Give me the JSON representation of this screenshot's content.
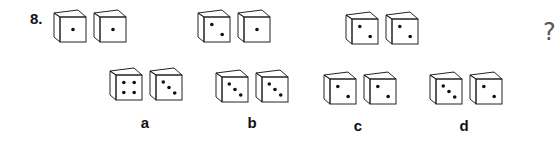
{
  "question": {
    "number": "8.",
    "missing_marker": "?",
    "sequence": [
      {
        "dice": [
          1,
          1
        ]
      },
      {
        "dice": [
          2,
          1
        ]
      },
      {
        "dice": [
          2,
          2
        ]
      }
    ]
  },
  "options": [
    {
      "label": "a",
      "dice": [
        4,
        3
      ]
    },
    {
      "label": "b",
      "dice": [
        3,
        3
      ]
    },
    {
      "label": "c",
      "dice": [
        2,
        2
      ]
    },
    {
      "label": "d",
      "dice": [
        3,
        2
      ]
    }
  ]
}
